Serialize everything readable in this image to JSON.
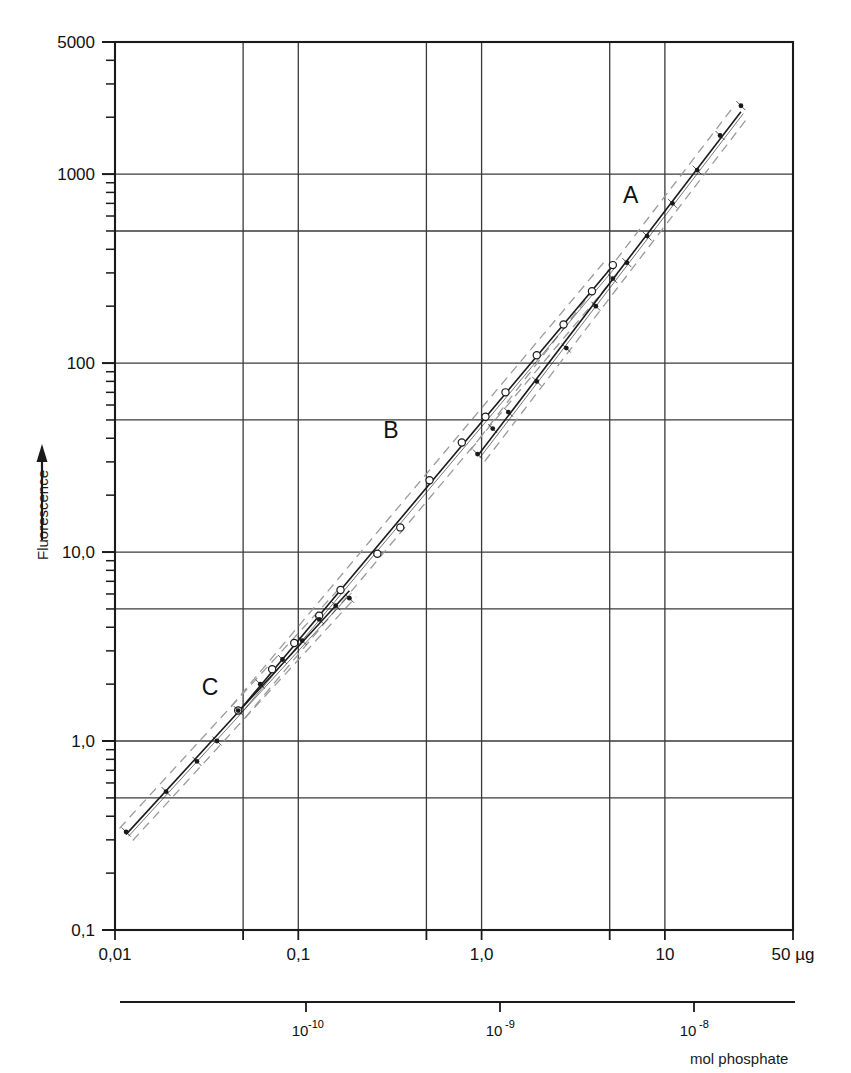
{
  "figure": {
    "y_axis": {
      "title": "Fluorescence",
      "arrow": "up-arrow-icon",
      "labels": [
        "5000",
        "1000",
        "100",
        "10,0",
        "1,0",
        "0,1"
      ],
      "values": [
        5000,
        1000,
        100,
        10,
        1,
        0.1
      ],
      "scale": "log",
      "min": 0.1,
      "max": 5000
    },
    "x_axis_primary": {
      "labels": [
        "0,01",
        "0,1",
        "1,0",
        "10",
        "50 µg"
      ],
      "values": [
        0.01,
        0.1,
        1.0,
        10,
        50
      ],
      "scale": "log",
      "min": 0.01,
      "max": 50,
      "unit": "µg"
    },
    "x_axis_secondary": {
      "labels": [
        "10",
        "10",
        "10"
      ],
      "exponents": [
        "-10",
        "-9",
        "-8"
      ],
      "values": [
        1e-10,
        1e-09,
        1e-08
      ],
      "title": "mol phosphate"
    },
    "curve_labels": {
      "a": "A",
      "b": "B",
      "c": "C"
    },
    "colors": {
      "ink": "#1a1a1a",
      "grid": "#3a3a3a",
      "band": "#9a9a9a"
    }
  },
  "chart_data": {
    "type": "line",
    "title": "",
    "subtitle": "",
    "xlabel": "mol phosphate",
    "ylabel": "Fluorescence",
    "xscale": "log",
    "yscale": "log",
    "xlim": [
      0.01,
      50
    ],
    "ylim": [
      0.1,
      5000
    ],
    "x_unit": "µg",
    "grid": true,
    "legend": "inline-labels",
    "x_ticks": [
      0.01,
      0.05,
      0.1,
      0.5,
      1.0,
      5,
      10,
      50
    ],
    "x_tick_labels": [
      "0,01",
      "",
      "0,1",
      "",
      "1,0",
      "",
      "10",
      "50 µg"
    ],
    "y_ticks": [
      0.1,
      0.5,
      1,
      5,
      10,
      50,
      100,
      500,
      1000,
      5000
    ],
    "y_tick_labels": [
      "0,1",
      "",
      "1,0",
      "",
      "10,0",
      "",
      "100",
      "",
      "1000",
      "5000"
    ],
    "secondary_x_ticks": [
      1e-10,
      1e-09,
      1e-08
    ],
    "secondary_x_tick_labels": [
      "10^-10",
      "10^-9",
      "10^-8"
    ],
    "series": [
      {
        "name": "A",
        "marker": "filled-dot",
        "label_x": 6.5,
        "label_y": 700,
        "band": "dashed",
        "x": [
          0.95,
          1.15,
          1.4,
          2.0,
          2.9,
          4.2,
          5.2,
          6.2,
          8.0,
          11.0,
          15.0,
          20.0,
          26.0
        ],
        "y": [
          33,
          45,
          55,
          80,
          120,
          200,
          280,
          340,
          470,
          700,
          1050,
          1600,
          2300
        ]
      },
      {
        "name": "B",
        "marker": "open-circle",
        "label_x": 0.32,
        "label_y": 40,
        "band": "dashed",
        "x": [
          0.047,
          0.072,
          0.095,
          0.13,
          0.17,
          0.27,
          0.36,
          0.52,
          0.78,
          1.05,
          1.35,
          2.0,
          2.8,
          4.0,
          5.2
        ],
        "y": [
          1.45,
          2.4,
          3.3,
          4.6,
          6.3,
          9.8,
          13.5,
          24,
          38,
          52,
          70,
          110,
          160,
          240,
          330
        ]
      },
      {
        "name": "C",
        "marker": "filled-dot",
        "label_x": 0.033,
        "label_y": 1.75,
        "band": "dashed",
        "x": [
          0.0115,
          0.019,
          0.028,
          0.036,
          0.047,
          0.062,
          0.082,
          0.105,
          0.13,
          0.16,
          0.19
        ],
        "y": [
          0.33,
          0.54,
          0.78,
          1.0,
          1.45,
          2.0,
          2.7,
          3.4,
          4.4,
          5.2,
          5.7
        ]
      }
    ],
    "annotations": [
      {
        "text": "A",
        "x": 6.5,
        "y": 700
      },
      {
        "text": "B",
        "x": 0.32,
        "y": 40
      },
      {
        "text": "C",
        "x": 0.033,
        "y": 1.75
      }
    ]
  }
}
